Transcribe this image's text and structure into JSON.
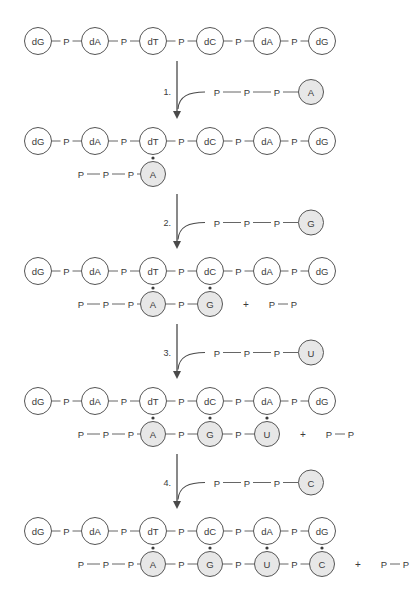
{
  "figure": {
    "colors": {
      "background": "#ffffff",
      "stroke": "#555555",
      "bond": "#666666",
      "dna_fill": "#ffffff",
      "rna_fill": "#e7e7e7",
      "text": "#3a3a3a",
      "arrow": "#4a4a4a"
    },
    "labels": {
      "phosphate": "P",
      "plus": "+",
      "pyrophosphate": [
        "P",
        "P"
      ]
    },
    "template_strand": [
      "dG",
      "dA",
      "dT",
      "dC",
      "dA",
      "dG"
    ],
    "rows": [
      {
        "id": "row-0",
        "template": [
          "dG",
          "dA",
          "dT",
          "dC",
          "dA",
          "dG"
        ],
        "rna": [],
        "triphosphate_prefix": [],
        "byproduct": null
      },
      {
        "id": "row-1",
        "template": [
          "dG",
          "dA",
          "dT",
          "dC",
          "dA",
          "dG"
        ],
        "rna": [
          "A"
        ],
        "triphosphate_prefix": [
          "P",
          "P",
          "P"
        ],
        "byproduct": null
      },
      {
        "id": "row-2",
        "template": [
          "dG",
          "dA",
          "dT",
          "dC",
          "dA",
          "dG"
        ],
        "rna": [
          "A",
          "G"
        ],
        "triphosphate_prefix": [
          "P",
          "P",
          "P"
        ],
        "byproduct": [
          "P",
          "P"
        ]
      },
      {
        "id": "row-3",
        "template": [
          "dG",
          "dA",
          "dT",
          "dC",
          "dA",
          "dG"
        ],
        "rna": [
          "A",
          "G",
          "U"
        ],
        "triphosphate_prefix": [
          "P",
          "P",
          "P"
        ],
        "byproduct": [
          "P",
          "P"
        ]
      },
      {
        "id": "row-4",
        "template": [
          "dG",
          "dA",
          "dT",
          "dC",
          "dA",
          "dG"
        ],
        "rna": [
          "A",
          "G",
          "U",
          "C"
        ],
        "triphosphate_prefix": [
          "P",
          "P",
          "P"
        ],
        "byproduct": [
          "P",
          "P"
        ]
      }
    ],
    "steps": [
      {
        "id": "step-1",
        "number": "1.",
        "reagent_chain": [
          "P",
          "P",
          "P"
        ],
        "reagent_base": "A"
      },
      {
        "id": "step-2",
        "number": "2.",
        "reagent_chain": [
          "P",
          "P",
          "P"
        ],
        "reagent_base": "G"
      },
      {
        "id": "step-3",
        "number": "3.",
        "reagent_chain": [
          "P",
          "P",
          "P"
        ],
        "reagent_base": "U"
      },
      {
        "id": "step-4",
        "number": "4.",
        "reagent_chain": [
          "P",
          "P",
          "P"
        ],
        "reagent_base": "C"
      }
    ]
  }
}
